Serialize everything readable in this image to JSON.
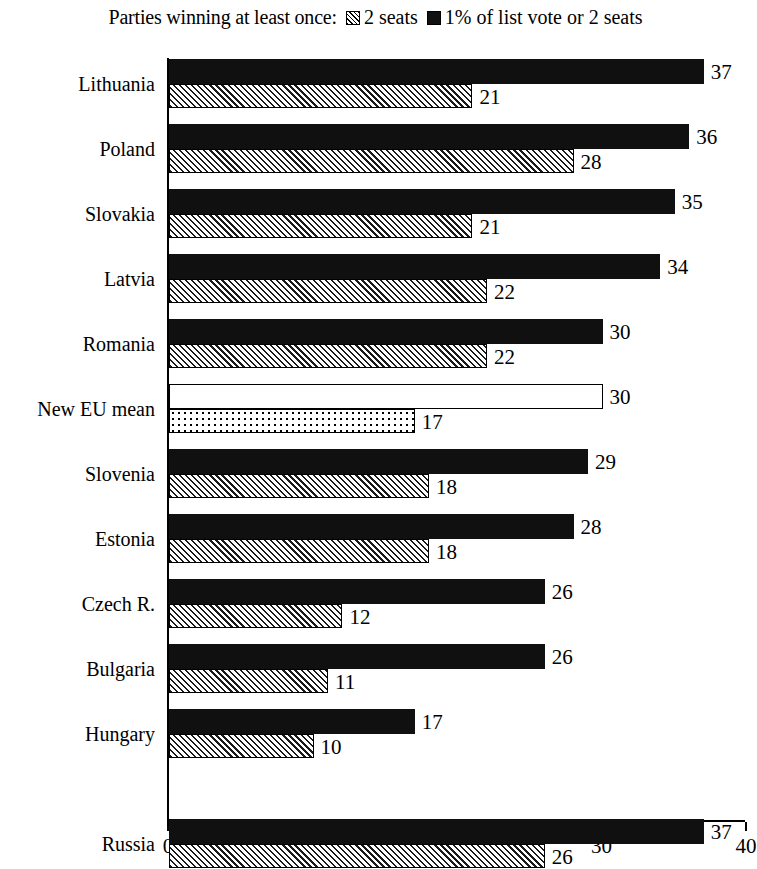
{
  "legend": {
    "title": "Parties winning at least once:",
    "entries": [
      {
        "swatch": "hatch-square-icon",
        "label": "2 seats"
      },
      {
        "swatch": "solid-square-icon",
        "label": "1% of list vote or 2 seats"
      }
    ]
  },
  "axis": {
    "x_ticks": [
      "0",
      "10",
      "20",
      "30",
      "40"
    ],
    "x_min": 0,
    "x_max": 40
  },
  "chart_data": {
    "type": "bar",
    "orientation": "horizontal",
    "title": "Parties winning at least once:",
    "xlabel": "",
    "ylabel": "",
    "xlim": [
      0,
      40
    ],
    "xticks": [
      0,
      10,
      20,
      30,
      40
    ],
    "grid": false,
    "legend_position": "top",
    "categories": [
      "Lithuania",
      "Poland",
      "Slovakia",
      "Latvia",
      "Romania",
      "New EU mean",
      "Slovenia",
      "Estonia",
      "Czech R.",
      "Bulgaria",
      "Hungary",
      "Russia"
    ],
    "series": [
      {
        "name": "1% of list vote or 2 seats",
        "style": "solid-black",
        "values": [
          37,
          36,
          35,
          34,
          30,
          30,
          29,
          28,
          26,
          26,
          17,
          37
        ]
      },
      {
        "name": "2 seats",
        "style": "hatched",
        "values": [
          21,
          28,
          21,
          22,
          22,
          17,
          18,
          18,
          12,
          11,
          10,
          26
        ]
      }
    ],
    "highlight_row": "New EU mean",
    "highlight_styles": {
      "1% of list vote or 2 seats": "white-outline",
      "2 seats": "dotted"
    },
    "separated_row": "Russia"
  },
  "rows": [
    {
      "label": "Lithuania",
      "black": 37,
      "hatch": 21,
      "black_style": "black",
      "hatch_style": "hatched",
      "group_top": 25
    },
    {
      "label": "Poland",
      "black": 36,
      "hatch": 28,
      "black_style": "black",
      "hatch_style": "hatched",
      "group_top": 90
    },
    {
      "label": "Slovakia",
      "black": 35,
      "hatch": 21,
      "black_style": "black",
      "hatch_style": "hatched",
      "group_top": 155
    },
    {
      "label": "Latvia",
      "black": 34,
      "hatch": 22,
      "black_style": "black",
      "hatch_style": "hatched",
      "group_top": 220
    },
    {
      "label": "Romania",
      "black": 30,
      "hatch": 22,
      "black_style": "black",
      "hatch_style": "hatched",
      "group_top": 285
    },
    {
      "label": "New EU mean",
      "black": 30,
      "hatch": 17,
      "black_style": "outline",
      "hatch_style": "dotted",
      "group_top": 350
    },
    {
      "label": "Slovenia",
      "black": 29,
      "hatch": 18,
      "black_style": "black",
      "hatch_style": "hatched",
      "group_top": 415
    },
    {
      "label": "Estonia",
      "black": 28,
      "hatch": 18,
      "black_style": "black",
      "hatch_style": "hatched",
      "group_top": 480
    },
    {
      "label": "Czech R.",
      "black": 26,
      "hatch": 12,
      "black_style": "black",
      "hatch_style": "hatched",
      "group_top": 545
    },
    {
      "label": "Bulgaria",
      "black": 26,
      "hatch": 11,
      "black_style": "black",
      "hatch_style": "hatched",
      "group_top": 610
    },
    {
      "label": "Hungary",
      "black": 17,
      "hatch": 10,
      "black_style": "black",
      "hatch_style": "hatched",
      "group_top": 675
    },
    {
      "label": "Russia",
      "black": 37,
      "hatch": 26,
      "black_style": "black",
      "hatch_style": "hatched",
      "group_top": 785
    }
  ]
}
